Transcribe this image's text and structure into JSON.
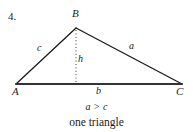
{
  "figure": {
    "item_number": "4.",
    "vertices": [
      {
        "name": "vertex-a",
        "label": "A",
        "x": 16,
        "y": 84
      },
      {
        "name": "vertex-b",
        "label": "B",
        "x": 76,
        "y": 28
      },
      {
        "name": "vertex-c",
        "label": "C",
        "x": 182,
        "y": 84
      }
    ],
    "sides": [
      {
        "name": "side-c",
        "label": "c",
        "from": "A",
        "to": "B"
      },
      {
        "name": "side-a",
        "label": "a",
        "from": "B",
        "to": "C"
      },
      {
        "name": "side-b",
        "label": "b",
        "from": "A",
        "to": "C"
      }
    ],
    "altitude": {
      "label": "h",
      "from_x": 76,
      "from_y": 28,
      "to_x": 76,
      "to_y": 84,
      "style": "dotted"
    },
    "colors": {
      "ink": "#1a1a1a",
      "base_line": "#333333",
      "background": "#ffffff"
    }
  },
  "caption": {
    "inequality": "a > c",
    "conclusion": "one triangle"
  }
}
